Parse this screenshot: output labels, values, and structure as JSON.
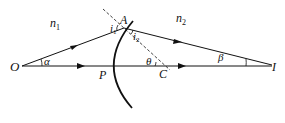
{
  "diagram": {
    "labels": {
      "n1": "n",
      "n1_sub": "1",
      "n2": "n",
      "n2_sub": "2",
      "O": "O",
      "A": "A",
      "P": "P",
      "C": "C",
      "I": "I",
      "alpha": "α",
      "beta": "β",
      "theta": "θ",
      "i1": "i",
      "i1_sub": "1",
      "i2": "i",
      "i2_sub": "2"
    },
    "colors": {
      "line": "#111111",
      "background": "#ffffff"
    }
  }
}
